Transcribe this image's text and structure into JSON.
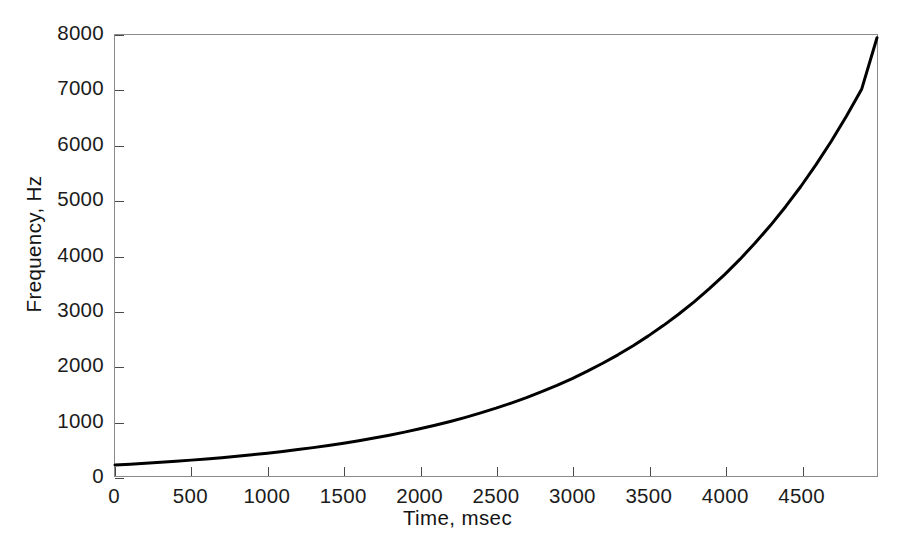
{
  "chart_data": {
    "type": "line",
    "title": "",
    "xlabel": "Time, msec",
    "ylabel": "Frequency, Hz",
    "xlim": [
      0,
      5000
    ],
    "ylim": [
      0,
      8000
    ],
    "grid": false,
    "legend": null,
    "line_color": "#000000",
    "line_width": 3,
    "xticks": [
      0,
      500,
      1000,
      1500,
      2000,
      2500,
      3000,
      3500,
      4000,
      4500
    ],
    "xtick_labels": [
      "0",
      "500",
      "1000",
      "1500",
      "2000",
      "2500",
      "3000",
      "3500",
      "4000",
      "4500"
    ],
    "yticks": [
      0,
      1000,
      2000,
      3000,
      4000,
      5000,
      6000,
      7000,
      8000
    ],
    "ytick_labels": [
      "0",
      "1000",
      "2000",
      "3000",
      "4000",
      "5000",
      "6000",
      "7000",
      "8000"
    ],
    "series": [
      {
        "name": "exponential chirp",
        "x": [
          0,
          100,
          200,
          300,
          400,
          500,
          600,
          700,
          800,
          900,
          1000,
          1100,
          1200,
          1300,
          1400,
          1500,
          1600,
          1700,
          1800,
          1900,
          2000,
          2100,
          2200,
          2300,
          2400,
          2500,
          2600,
          2700,
          2800,
          2900,
          3000,
          3100,
          3200,
          3300,
          3400,
          3500,
          3600,
          3700,
          3800,
          3900,
          4000,
          4100,
          4200,
          4300,
          4400,
          4500,
          4600,
          4700,
          4800,
          4900,
          5000
        ],
        "y": [
          200,
          215,
          231,
          249,
          267,
          288,
          309,
          333,
          358,
          385,
          414,
          445,
          479,
          515,
          553,
          595,
          640,
          688,
          740,
          796,
          856,
          920,
          989,
          1064,
          1144,
          1230,
          1323,
          1422,
          1530,
          1645,
          1768,
          1902,
          2045,
          2198,
          2364,
          2542,
          2733,
          2939,
          3160,
          3398,
          3654,
          3929,
          4225,
          4543,
          4885,
          5252,
          5648,
          6073,
          6530,
          7022,
          7950
        ]
      }
    ]
  },
  "axes": {
    "x_title": "Time, msec",
    "y_title": "Frequency, Hz"
  }
}
